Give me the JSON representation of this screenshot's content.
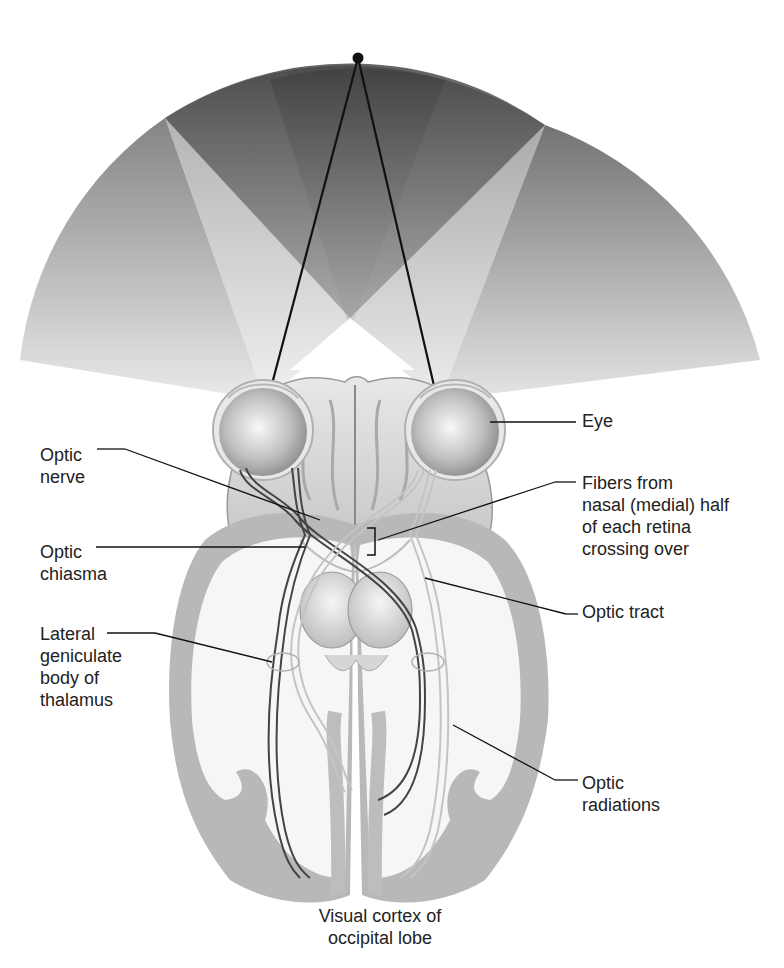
{
  "figure": {
    "labels": {
      "eye": "Eye",
      "optic_nerve": "Optic\nnerve",
      "optic_chiasma": "Optic\nchiasma",
      "fibers_crossing": "Fibers from\nnasal (medial) half\nof each retina\ncrossing over",
      "optic_tract": "Optic tract",
      "lateral_geniculate_body": "Lateral\ngeniculate\nbody of\nthalamus",
      "optic_radiations": "Optic\nradiations",
      "visual_cortex": "Visual cortex of\noccipital lobe"
    },
    "colors": {
      "fan_dark": "#3a3a3a",
      "fan_light": "#d8d8d8",
      "cortex_gray": "#b8b8b8",
      "white_matter": "#f4f4f4",
      "line": "#111111",
      "fiber_dark": "#444444",
      "fiber_light": "#c4c4c4"
    }
  }
}
